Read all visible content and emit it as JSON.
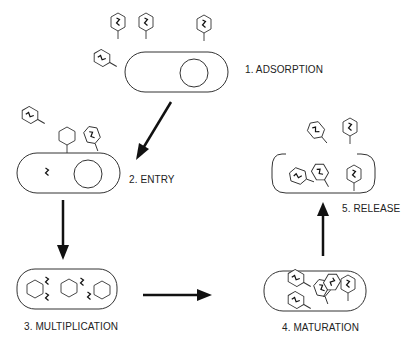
{
  "diagram": {
    "colors": {
      "stroke": "#333333",
      "arrow": "#111111",
      "text": "#222222",
      "background": "#ffffff"
    },
    "stages": [
      {
        "step": 1,
        "label": "1. ADSORPTION"
      },
      {
        "step": 2,
        "label": "2. ENTRY"
      },
      {
        "step": 3,
        "label": "3. MULTIPLICATION"
      },
      {
        "step": 4,
        "label": "4. MATURATION"
      },
      {
        "step": 5,
        "label": "5. RELEASE"
      }
    ],
    "arrows": [
      {
        "from": 1,
        "to": 2,
        "direction": "down-left"
      },
      {
        "from": 2,
        "to": 3,
        "direction": "down"
      },
      {
        "from": 3,
        "to": 4,
        "direction": "right"
      },
      {
        "from": 4,
        "to": 5,
        "direction": "up"
      }
    ]
  }
}
